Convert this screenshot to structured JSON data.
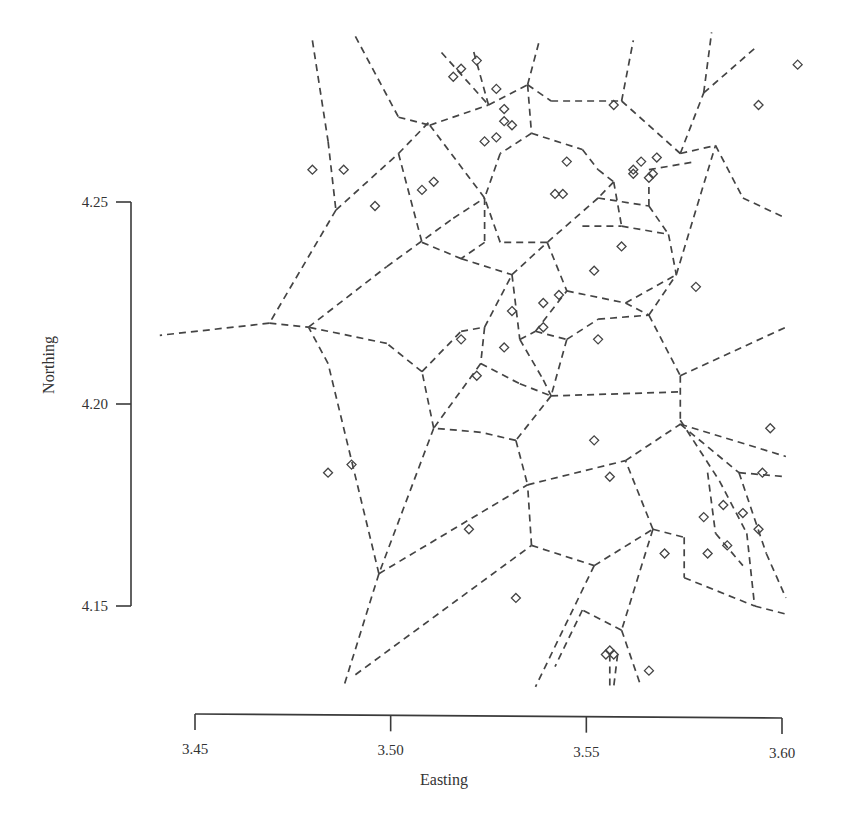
{
  "chart_data": {
    "type": "scatter",
    "subtype": "voronoi-tessellation",
    "title": "",
    "xlabel": "Easting",
    "ylabel": "Northing",
    "xlim": [
      3.45,
      3.6
    ],
    "ylim": [
      4.13,
      4.29
    ],
    "xticks": [
      3.45,
      3.5,
      3.55,
      3.6
    ],
    "xtick_labels": [
      "3.45",
      "3.50",
      "3.55",
      "3.60"
    ],
    "yticks": [
      4.15,
      4.2,
      4.25
    ],
    "ytick_labels": [
      "4.15",
      "4.20",
      "4.25"
    ],
    "grid": false,
    "legend": null,
    "marker": "diamond",
    "edge_style": "dashed",
    "points": [
      [
        3.516,
        4.281
      ],
      [
        3.518,
        4.283
      ],
      [
        3.522,
        4.285
      ],
      [
        3.527,
        4.278
      ],
      [
        3.557,
        4.274
      ],
      [
        3.594,
        4.274
      ],
      [
        3.604,
        4.284
      ],
      [
        3.529,
        4.273
      ],
      [
        3.529,
        4.27
      ],
      [
        3.524,
        4.265
      ],
      [
        3.527,
        4.266
      ],
      [
        3.531,
        4.269
      ],
      [
        3.562,
        4.257
      ],
      [
        3.567,
        4.257
      ],
      [
        3.568,
        4.261
      ],
      [
        3.564,
        4.26
      ],
      [
        3.562,
        4.258
      ],
      [
        3.566,
        4.256
      ],
      [
        3.545,
        4.26
      ],
      [
        3.48,
        4.258
      ],
      [
        3.488,
        4.258
      ],
      [
        3.496,
        4.249
      ],
      [
        3.508,
        4.253
      ],
      [
        3.511,
        4.255
      ],
      [
        3.542,
        4.252
      ],
      [
        3.544,
        4.252
      ],
      [
        3.559,
        4.239
      ],
      [
        3.552,
        4.233
      ],
      [
        3.578,
        4.229
      ],
      [
        3.531,
        4.223
      ],
      [
        3.539,
        4.225
      ],
      [
        3.543,
        4.227
      ],
      [
        3.539,
        4.219
      ],
      [
        3.518,
        4.216
      ],
      [
        3.529,
        4.214
      ],
      [
        3.553,
        4.216
      ],
      [
        3.522,
        4.207
      ],
      [
        3.552,
        4.191
      ],
      [
        3.556,
        4.182
      ],
      [
        3.597,
        4.194
      ],
      [
        3.484,
        4.183
      ],
      [
        3.49,
        4.185
      ],
      [
        3.595,
        4.183
      ],
      [
        3.52,
        4.169
      ],
      [
        3.58,
        4.172
      ],
      [
        3.585,
        4.175
      ],
      [
        3.59,
        4.173
      ],
      [
        3.594,
        4.169
      ],
      [
        3.57,
        4.163
      ],
      [
        3.581,
        4.163
      ],
      [
        3.586,
        4.165
      ],
      [
        3.532,
        4.152
      ],
      [
        3.555,
        4.138
      ],
      [
        3.556,
        4.139
      ],
      [
        3.557,
        4.138
      ],
      [
        3.566,
        4.134
      ]
    ],
    "edges": [
      [
        3.48,
        4.29,
        3.484,
        4.265
      ],
      [
        3.484,
        4.265,
        3.486,
        4.248
      ],
      [
        3.486,
        4.248,
        3.469,
        4.22
      ],
      [
        3.469,
        4.22,
        3.441,
        4.217
      ],
      [
        3.469,
        4.22,
        3.479,
        4.219
      ],
      [
        3.479,
        4.219,
        3.499,
        4.234
      ],
      [
        3.499,
        4.234,
        3.516,
        4.246
      ],
      [
        3.516,
        4.246,
        3.524,
        4.251
      ],
      [
        3.486,
        4.248,
        3.502,
        4.262
      ],
      [
        3.502,
        4.262,
        3.51,
        4.27
      ],
      [
        3.491,
        4.291,
        3.502,
        4.271
      ],
      [
        3.502,
        4.271,
        3.51,
        4.269
      ],
      [
        3.51,
        4.269,
        3.525,
        4.274
      ],
      [
        3.525,
        4.274,
        3.535,
        4.279
      ],
      [
        3.535,
        4.279,
        3.538,
        4.29
      ],
      [
        3.525,
        4.274,
        3.521,
        4.288
      ],
      [
        3.513,
        4.287,
        3.525,
        4.274
      ],
      [
        3.51,
        4.269,
        3.524,
        4.251
      ],
      [
        3.502,
        4.262,
        3.508,
        4.24
      ],
      [
        3.535,
        4.279,
        3.541,
        4.275
      ],
      [
        3.541,
        4.275,
        3.559,
        4.275
      ],
      [
        3.559,
        4.275,
        3.562,
        4.29
      ],
      [
        3.559,
        4.275,
        3.574,
        4.262
      ],
      [
        3.574,
        4.262,
        3.583,
        4.264
      ],
      [
        3.535,
        4.279,
        3.536,
        4.267
      ],
      [
        3.536,
        4.267,
        3.549,
        4.263
      ],
      [
        3.549,
        4.263,
        3.553,
        4.258
      ],
      [
        3.553,
        4.258,
        3.557,
        4.255
      ],
      [
        3.557,
        4.255,
        3.553,
        4.251
      ],
      [
        3.553,
        4.251,
        3.54,
        4.24
      ],
      [
        3.553,
        4.251,
        3.566,
        4.249
      ],
      [
        3.566,
        4.249,
        3.571,
        4.242
      ],
      [
        3.566,
        4.249,
        3.566,
        4.255
      ],
      [
        3.54,
        4.24,
        3.528,
        4.24
      ],
      [
        3.528,
        4.24,
        3.524,
        4.251
      ],
      [
        3.536,
        4.267,
        3.528,
        4.262
      ],
      [
        3.528,
        4.262,
        3.524,
        4.251
      ],
      [
        3.574,
        4.262,
        3.58,
        4.277
      ],
      [
        3.58,
        4.277,
        3.582,
        4.292
      ],
      [
        3.58,
        4.277,
        3.593,
        4.288
      ],
      [
        3.583,
        4.264,
        3.59,
        4.251
      ],
      [
        3.59,
        4.251,
        3.601,
        4.246
      ],
      [
        3.571,
        4.242,
        3.573,
        4.232
      ],
      [
        3.573,
        4.232,
        3.583,
        4.264
      ],
      [
        3.566,
        4.258,
        3.578,
        4.26
      ],
      [
        3.557,
        4.255,
        3.559,
        4.244
      ],
      [
        3.559,
        4.244,
        3.571,
        4.242
      ],
      [
        3.549,
        4.244,
        3.559,
        4.244
      ],
      [
        3.524,
        4.251,
        3.524,
        4.24
      ],
      [
        3.524,
        4.24,
        3.518,
        4.236
      ],
      [
        3.508,
        4.24,
        3.518,
        4.236
      ],
      [
        3.518,
        4.236,
        3.531,
        4.232
      ],
      [
        3.531,
        4.232,
        3.54,
        4.24
      ],
      [
        3.54,
        4.24,
        3.545,
        4.228
      ],
      [
        3.545,
        4.228,
        3.56,
        4.225
      ],
      [
        3.56,
        4.225,
        3.573,
        4.232
      ],
      [
        3.56,
        4.225,
        3.566,
        4.222
      ],
      [
        3.566,
        4.222,
        3.573,
        4.232
      ],
      [
        3.531,
        4.232,
        3.533,
        4.216
      ],
      [
        3.533,
        4.216,
        3.537,
        4.218
      ],
      [
        3.537,
        4.218,
        3.545,
        4.228
      ],
      [
        3.537,
        4.218,
        3.545,
        4.216
      ],
      [
        3.545,
        4.216,
        3.553,
        4.221
      ],
      [
        3.553,
        4.221,
        3.566,
        4.222
      ],
      [
        3.545,
        4.216,
        3.541,
        4.202
      ],
      [
        3.533,
        4.216,
        3.539,
        4.206
      ],
      [
        3.539,
        4.206,
        3.541,
        4.202
      ],
      [
        3.566,
        4.222,
        3.574,
        4.207
      ],
      [
        3.574,
        4.207,
        3.601,
        4.219
      ],
      [
        3.574,
        4.207,
        3.574,
        4.195
      ],
      [
        3.541,
        4.202,
        3.574,
        4.203
      ],
      [
        3.541,
        4.202,
        3.532,
        4.191
      ],
      [
        3.532,
        4.191,
        3.523,
        4.193
      ],
      [
        3.523,
        4.193,
        3.511,
        4.194
      ],
      [
        3.511,
        4.194,
        3.508,
        4.208
      ],
      [
        3.508,
        4.208,
        3.499,
        4.215
      ],
      [
        3.499,
        4.215,
        3.479,
        4.219
      ],
      [
        3.508,
        4.208,
        3.518,
        4.218
      ],
      [
        3.518,
        4.218,
        3.524,
        4.219
      ],
      [
        3.524,
        4.219,
        3.531,
        4.232
      ],
      [
        3.524,
        4.219,
        3.523,
        4.21
      ],
      [
        3.523,
        4.21,
        3.533,
        4.205
      ],
      [
        3.533,
        4.205,
        3.541,
        4.202
      ],
      [
        3.523,
        4.21,
        3.511,
        4.194
      ],
      [
        3.511,
        4.194,
        3.497,
        4.158
      ],
      [
        3.497,
        4.158,
        3.484,
        4.21
      ],
      [
        3.484,
        4.21,
        3.479,
        4.219
      ],
      [
        3.497,
        4.158,
        3.488,
        4.13
      ],
      [
        3.497,
        4.158,
        3.535,
        4.18
      ],
      [
        3.491,
        4.133,
        3.536,
        4.165
      ],
      [
        3.536,
        4.165,
        3.535,
        4.18
      ],
      [
        3.532,
        4.191,
        3.535,
        4.18
      ],
      [
        3.535,
        4.18,
        3.56,
        4.186
      ],
      [
        3.56,
        4.186,
        3.574,
        4.195
      ],
      [
        3.574,
        4.195,
        3.601,
        4.187
      ],
      [
        3.574,
        4.195,
        3.589,
        4.183
      ],
      [
        3.589,
        4.183,
        3.601,
        4.182
      ],
      [
        3.536,
        4.165,
        3.552,
        4.16
      ],
      [
        3.552,
        4.16,
        3.567,
        4.169
      ],
      [
        3.567,
        4.169,
        3.56,
        4.186
      ],
      [
        3.567,
        4.169,
        3.575,
        4.167
      ],
      [
        3.575,
        4.167,
        3.575,
        4.157
      ],
      [
        3.575,
        4.157,
        3.593,
        4.15
      ],
      [
        3.593,
        4.15,
        3.601,
        4.148
      ],
      [
        3.552,
        4.16,
        3.537,
        4.13
      ],
      [
        3.567,
        4.169,
        3.559,
        4.144
      ],
      [
        3.559,
        4.144,
        3.549,
        4.149
      ],
      [
        3.549,
        4.149,
        3.542,
        4.135
      ],
      [
        3.559,
        4.144,
        3.564,
        4.13
      ],
      [
        3.556,
        4.138,
        3.556,
        4.13
      ],
      [
        3.558,
        4.138,
        3.557,
        4.13
      ],
      [
        3.574,
        4.196,
        3.584,
        4.181
      ],
      [
        3.584,
        4.181,
        3.591,
        4.168
      ],
      [
        3.591,
        4.168,
        3.593,
        4.15
      ],
      [
        3.589,
        4.183,
        3.596,
        4.163
      ],
      [
        3.596,
        4.163,
        3.601,
        4.152
      ],
      [
        3.581,
        4.183,
        3.583,
        4.168
      ],
      [
        3.583,
        4.168,
        3.59,
        4.16
      ]
    ]
  },
  "plot_area": {
    "x_axis": {
      "px_min": 195,
      "px_max": 782,
      "val_min": 3.45,
      "val_max": 3.6,
      "line_y": 714
    },
    "y_axis": {
      "px_top": 202,
      "px_bottom": 606,
      "val_top": 4.25,
      "val_bottom": 4.15,
      "line_x": 131
    }
  }
}
